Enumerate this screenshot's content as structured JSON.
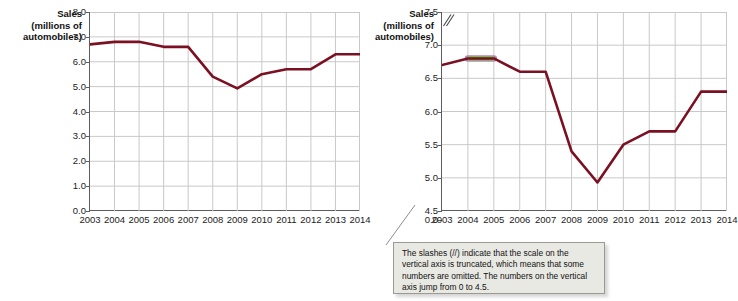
{
  "figure": {
    "name": "new-car-sales-truncated-axis-comparison"
  },
  "chart_data": [
    {
      "id": "left-chart",
      "type": "line",
      "title": "",
      "ylabel": "Sales (millions of automobiles)",
      "ylabel_lines": [
        "Sales",
        "(millions of",
        "automobiles)"
      ],
      "xlabel": "",
      "categories": [
        2003,
        2004,
        2005,
        2006,
        2007,
        2008,
        2009,
        2010,
        2011,
        2012,
        2013,
        2014
      ],
      "x_ticklabels": [
        "2003",
        "2004",
        "2005",
        "2006",
        "2007",
        "2008",
        "2009",
        "2010",
        "2011",
        "2012",
        "2013",
        "2014"
      ],
      "values": [
        6.7,
        6.8,
        6.8,
        6.6,
        6.6,
        5.4,
        4.93,
        5.5,
        5.7,
        5.7,
        6.3,
        6.3
      ],
      "ylim": [
        0.0,
        8.0
      ],
      "y_ticks": [
        0.0,
        1.0,
        2.0,
        3.0,
        4.0,
        5.0,
        6.0,
        7.0,
        8.0
      ],
      "y_ticklabels": [
        "0.0",
        "1.0",
        "2.0",
        "3.0",
        "4.0",
        "5.0",
        "6.0",
        "7.0",
        "8.0"
      ],
      "truncated_axis": false,
      "grid": true,
      "legend": "none",
      "line_color": "#7b1022"
    },
    {
      "id": "right-chart",
      "type": "line",
      "title": "",
      "ylabel": "Sales (millions of automobiles)",
      "ylabel_lines": [
        "Sales",
        "(millions of",
        "automobiles)"
      ],
      "xlabel": "",
      "categories": [
        2003,
        2004,
        2005,
        2006,
        2007,
        2008,
        2009,
        2010,
        2011,
        2012,
        2013,
        2014
      ],
      "x_ticklabels": [
        "2003",
        "2004",
        "2005",
        "2006",
        "2007",
        "2008",
        "2009",
        "2010",
        "2011",
        "2012",
        "2013",
        "2014"
      ],
      "values": [
        6.7,
        6.8,
        6.8,
        6.6,
        6.6,
        5.4,
        4.93,
        5.5,
        5.7,
        5.7,
        6.3,
        6.3
      ],
      "ylim": [
        4.5,
        7.5
      ],
      "y_ticks": [
        0.0,
        4.5,
        5.0,
        5.5,
        6.0,
        6.5,
        7.0,
        7.5
      ],
      "y_ticklabels": [
        "0.0",
        "4.5",
        "5.0",
        "5.5",
        "6.0",
        "6.5",
        "7.0",
        "7.5"
      ],
      "truncated_axis": true,
      "axis_break_between": [
        0.0,
        4.5
      ],
      "grid": true,
      "legend": "none",
      "line_color": "#7b1022",
      "highlight_segment": {
        "from": 2004,
        "to": 2005,
        "color": "#66cc33"
      }
    }
  ],
  "callout": {
    "text": "The slashes (//) indicate that the scale on the vertical axis is truncated, which means that some numbers are omitted.  The numbers on the vertical axis jump from 0 to 4.5."
  }
}
